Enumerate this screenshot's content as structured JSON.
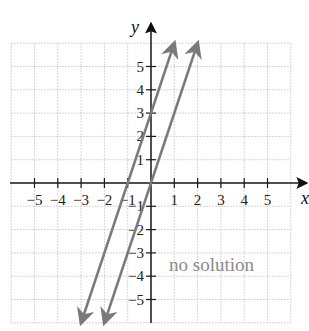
{
  "chart_data": {
    "type": "line",
    "title": "",
    "xlabel": "x",
    "ylabel": "y",
    "xlim": [
      -6,
      6
    ],
    "ylim": [
      -6,
      6
    ],
    "grid": true,
    "x_ticks": [
      -5,
      -4,
      -3,
      -2,
      -1,
      1,
      2,
      3,
      4,
      5
    ],
    "y_ticks": [
      -5,
      -4,
      -3,
      -2,
      -1,
      1,
      2,
      3,
      4,
      5
    ],
    "series": [
      {
        "name": "y = 3x + 3",
        "x": [
          -3,
          1
        ],
        "y": [
          -6,
          6
        ],
        "color": "#7a7a7a",
        "arrows": "both"
      },
      {
        "name": "y = 3x",
        "x": [
          -2,
          2
        ],
        "y": [
          -6,
          6
        ],
        "color": "#7a7a7a",
        "arrows": "both"
      }
    ],
    "annotations": [
      {
        "text": "no solution",
        "x": 2.4,
        "y": -3.6
      }
    ]
  },
  "labels": {
    "x_axis": "x",
    "y_axis": "y",
    "annotation": "no solution"
  },
  "colors": {
    "axis": "#1a1a1a",
    "grid": "#c8c8c8",
    "lines": "#7a7a7a",
    "annotation": "#8a8a8a"
  }
}
